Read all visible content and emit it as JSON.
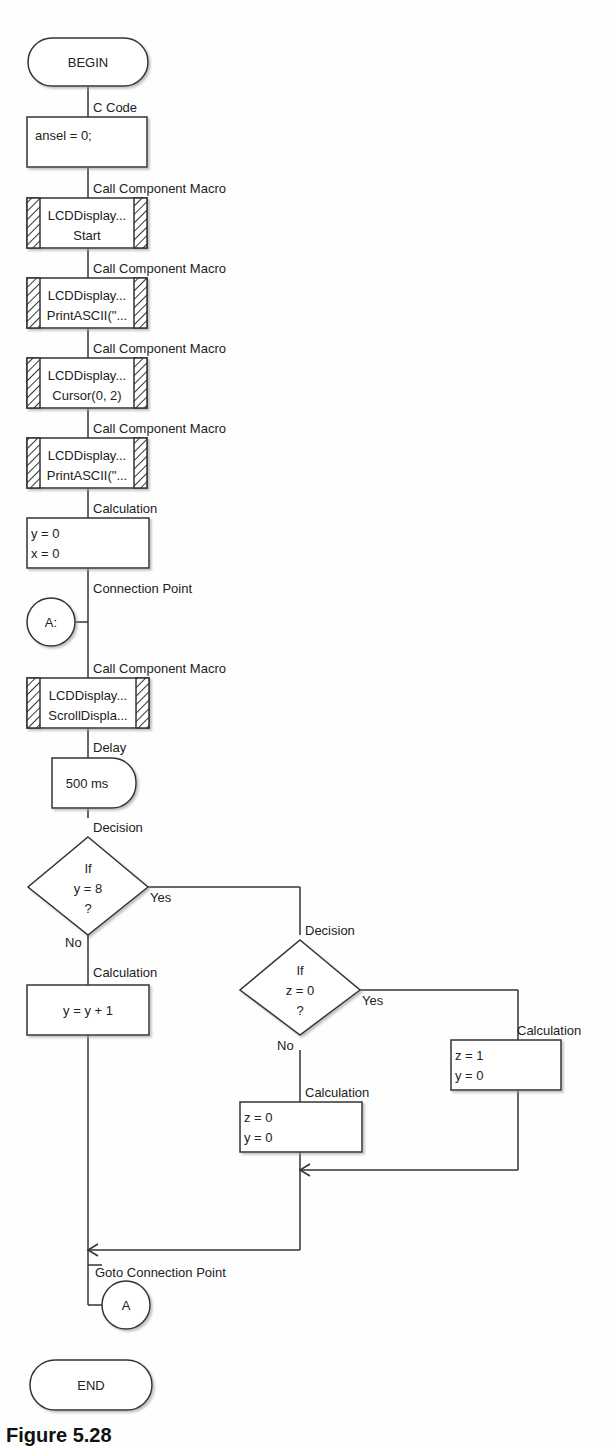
{
  "diagram": {
    "begin": "BEGIN",
    "end": "END",
    "nodes": [
      {
        "type": "c_code",
        "label": "C Code",
        "lines": [
          "ansel = 0;"
        ]
      },
      {
        "type": "macro",
        "label": "Call Component Macro",
        "lines": [
          "LCDDisplay...",
          "Start"
        ]
      },
      {
        "type": "macro",
        "label": "Call Component Macro",
        "lines": [
          "LCDDisplay...",
          "PrintASCII(\"..."
        ]
      },
      {
        "type": "macro",
        "label": "Call Component Macro",
        "lines": [
          "LCDDisplay...",
          "Cursor(0, 2)"
        ]
      },
      {
        "type": "macro",
        "label": "Call Component Macro",
        "lines": [
          "LCDDisplay...",
          "PrintASCII(\"..."
        ]
      },
      {
        "type": "calculation",
        "label": "Calculation",
        "lines": [
          "y = 0",
          "x = 0"
        ]
      },
      {
        "type": "connection_point",
        "label": "Connection Point",
        "text": "A:"
      },
      {
        "type": "macro",
        "label": "Call Component Macro",
        "lines": [
          "LCDDisplay...",
          "ScrollDispla..."
        ]
      },
      {
        "type": "delay",
        "label": "Delay",
        "text": "500 ms"
      },
      {
        "type": "decision",
        "label": "Decision",
        "lines": [
          "If",
          "y = 8",
          "?"
        ],
        "yes": "Yes",
        "no": "No"
      },
      {
        "type": "calculation",
        "label": "Calculation",
        "lines": [
          "y = y + 1"
        ]
      },
      {
        "type": "decision",
        "label": "Decision",
        "lines": [
          "If",
          "z = 0",
          "?"
        ],
        "yes": "Yes",
        "no": "No"
      },
      {
        "type": "calculation",
        "label": "Calculation",
        "lines": [
          "z = 1",
          "y = 0"
        ]
      },
      {
        "type": "calculation",
        "label": "Calculation",
        "lines": [
          "z = 0",
          "y = 0"
        ]
      },
      {
        "type": "goto",
        "label": "Goto Connection Point",
        "text": "A"
      }
    ]
  },
  "caption": "Figure 5.28"
}
